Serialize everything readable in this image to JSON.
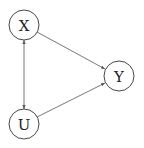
{
  "diagram": {
    "type": "causal-dag",
    "nodes": [
      {
        "id": "X",
        "label": "X",
        "cx": 24,
        "cy": 25,
        "r": 15
      },
      {
        "id": "Y",
        "label": "Y",
        "cx": 119,
        "cy": 76,
        "r": 15
      },
      {
        "id": "U",
        "label": "U",
        "cx": 24,
        "cy": 124,
        "r": 15
      }
    ],
    "edges": [
      {
        "from": "X",
        "to": "Y",
        "direction": "forward"
      },
      {
        "from": "U",
        "to": "Y",
        "direction": "forward"
      },
      {
        "from": "X",
        "to": "U",
        "direction": "bidirectional"
      }
    ],
    "colors": {
      "stroke": "#333333",
      "edge": "#555555",
      "background": "#ffffff"
    }
  }
}
